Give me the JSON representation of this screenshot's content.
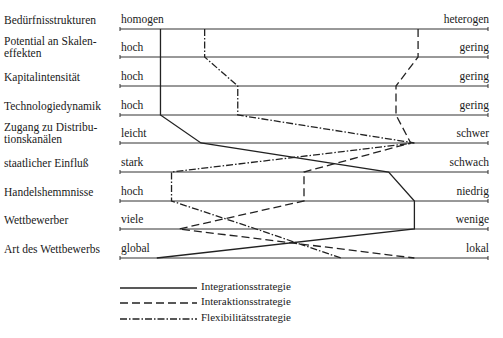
{
  "rows": [
    {
      "label": "Bedürfnisstrukturen",
      "left": "homogen",
      "right": "heterogen"
    },
    {
      "label": "Potential an Skalen-\neffekten",
      "left": "hoch",
      "right": "gering"
    },
    {
      "label": "Kapitalintensität",
      "left": "hoch",
      "right": "gering"
    },
    {
      "label": "Technologiedynamik",
      "left": "hoch",
      "right": "gering"
    },
    {
      "label": "Zugang zu Distribu-\ntionskanälen",
      "left": "leicht",
      "right": "schwer"
    },
    {
      "label": "staatlicher Einfluß",
      "left": "stark",
      "right": "schwach"
    },
    {
      "label": "Handelshemmnisse",
      "left": "hoch",
      "right": "niedrig"
    },
    {
      "label": "Wettbewerber",
      "left": "viele",
      "right": "wenige"
    },
    {
      "label": "Art des Wettbewerbs",
      "left": "global",
      "right": "lokal"
    }
  ],
  "legend": [
    {
      "label": "Integrationsstrategie",
      "style": "solid"
    },
    {
      "label": "Interaktionsstrategie",
      "style": "dashed"
    },
    {
      "label": "Flexibilitätsstrategie",
      "style": "dash-dot"
    }
  ],
  "chart_data": {
    "type": "line",
    "title": "",
    "categories": [
      "Bedürfnisstrukturen",
      "Potential an Skaleneffekten",
      "Kapitalintensität",
      "Technologiedynamik",
      "Zugang zu Distributionskanälen",
      "staatlicher Einfluß",
      "Handelshemmnisse",
      "Wettbewerber",
      "Art des Wettbewerbs"
    ],
    "scale_note": "0 = left pole, 1 = right pole",
    "series": [
      {
        "name": "Integrationsstrategie",
        "values": [
          0.11,
          0.11,
          0.11,
          0.11,
          0.22,
          0.73,
          0.8,
          0.8,
          0.1
        ]
      },
      {
        "name": "Interaktionsstrategie",
        "values": [
          0.81,
          0.81,
          0.75,
          0.75,
          0.79,
          0.5,
          0.5,
          0.16,
          0.8
        ]
      },
      {
        "name": "Flexibilitätsstrategie",
        "values": [
          0.23,
          0.23,
          0.32,
          0.32,
          0.8,
          0.14,
          0.14,
          0.37,
          0.6
        ]
      }
    ]
  }
}
